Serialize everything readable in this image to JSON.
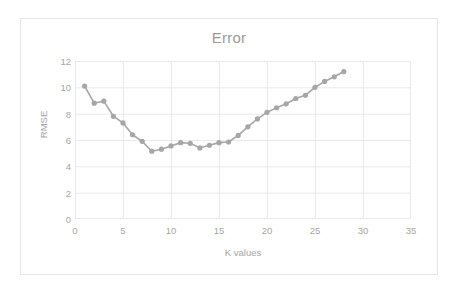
{
  "chart_data": {
    "type": "line",
    "title": "Error",
    "xlabel": "K values",
    "ylabel": "RMSE",
    "xlim": [
      0,
      35
    ],
    "ylim": [
      0,
      12
    ],
    "xticks": [
      0,
      5,
      10,
      15,
      20,
      25,
      30,
      35
    ],
    "yticks": [
      0,
      2,
      4,
      6,
      8,
      10,
      12
    ],
    "grid": true,
    "legend": "none",
    "marker": "circle",
    "series_color": "#a6a6a6",
    "x": [
      1,
      2,
      3,
      4,
      5,
      6,
      7,
      8,
      9,
      10,
      11,
      12,
      13,
      14,
      15,
      16,
      17,
      18,
      19,
      20,
      21,
      22,
      23,
      24,
      25,
      26,
      27,
      28
    ],
    "values": [
      10.1,
      8.8,
      8.95,
      7.8,
      7.3,
      6.4,
      5.9,
      5.15,
      5.3,
      5.55,
      5.8,
      5.75,
      5.4,
      5.6,
      5.8,
      5.85,
      6.35,
      7.0,
      7.6,
      8.1,
      8.45,
      8.75,
      9.15,
      9.4,
      10.0,
      10.45,
      10.8,
      11.2
    ],
    "series": [
      {
        "name": "RMSE",
        "values": [
          10.1,
          8.8,
          8.95,
          7.8,
          7.3,
          6.4,
          5.9,
          5.15,
          5.3,
          5.55,
          5.8,
          5.75,
          5.4,
          5.6,
          5.8,
          5.85,
          6.35,
          7.0,
          7.6,
          8.1,
          8.45,
          8.75,
          9.15,
          9.4,
          10.0,
          10.45,
          10.8,
          11.2
        ]
      }
    ]
  },
  "colors": {
    "series": "#a6a6a6",
    "grid": "#e9e9e9",
    "axis_text": "#a5a5a5",
    "title_text": "#9a9a9a",
    "frame": "#e6e6e6"
  }
}
